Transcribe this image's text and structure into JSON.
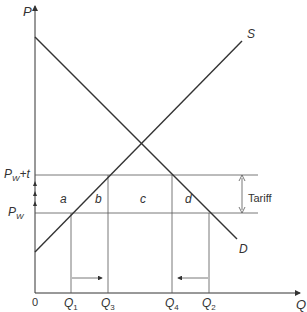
{
  "diagram": {
    "axes": {
      "y_label": "P",
      "x_label": "Q",
      "origin_label": "0"
    },
    "curves": {
      "supply_label": "S",
      "demand_label": "D"
    },
    "price_levels": [
      {
        "id": "pw_t",
        "label_main": "P",
        "label_sub": "W",
        "label_suffix": "+t"
      },
      {
        "id": "pw",
        "label_main": "P",
        "label_sub": "W",
        "label_suffix": ""
      }
    ],
    "quantities": [
      {
        "id": "q1",
        "main": "Q",
        "sub": "1"
      },
      {
        "id": "q3",
        "main": "Q",
        "sub": "3"
      },
      {
        "id": "q4",
        "main": "Q",
        "sub": "4"
      },
      {
        "id": "q2",
        "main": "Q",
        "sub": "2"
      }
    ],
    "areas": [
      "a",
      "b",
      "c",
      "d"
    ],
    "tariff_label": "Tariff",
    "colors": {
      "line": "#333333",
      "gridline": "#555555",
      "background": "#ffffff"
    }
  }
}
